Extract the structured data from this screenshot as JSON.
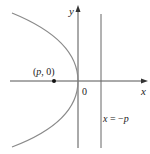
{
  "diagram": {
    "type": "parabola-focus-directrix",
    "labels": {
      "y_axis": "y",
      "x_axis": "x",
      "origin": "0",
      "focus_open": "(",
      "focus_p": "p",
      "focus_rest": ", 0)",
      "directrix_x": "x",
      "directrix_eq": " = −",
      "directrix_p": "p"
    },
    "colors": {
      "axes": "#555555",
      "curve": "#8a8a8a",
      "directrix": "#666666",
      "focus_point": "#111111",
      "text": "#222222"
    }
  }
}
